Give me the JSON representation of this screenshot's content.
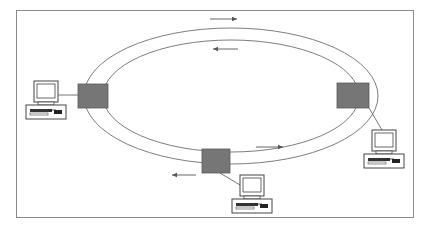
{
  "diagram": {
    "type": "token-ring-network",
    "frame": {
      "x": 16,
      "y": 10,
      "width": 397,
      "height": 207,
      "stroke": "#8a8a8a"
    },
    "colors": {
      "background": "#ffffff",
      "ring_line": "#6e6e6e",
      "switch_fill": "#767676",
      "switch_stroke": "#5a5a5a",
      "computer_stroke": "#444444",
      "arrow": "#555555"
    },
    "ring": {
      "outer": {
        "cx": 231,
        "cy": 96,
        "rx": 147,
        "ry": 68
      },
      "inner": {
        "cx": 231,
        "cy": 96,
        "rx": 128,
        "ry": 56
      }
    },
    "switches": [
      {
        "id": "left",
        "x": 78,
        "y": 84,
        "w": 30,
        "h": 24
      },
      {
        "id": "right",
        "x": 337,
        "y": 83,
        "w": 32,
        "h": 25
      },
      {
        "id": "bottom",
        "x": 202,
        "y": 149,
        "w": 28,
        "h": 24
      }
    ],
    "computers": [
      {
        "id": "left",
        "x": 26,
        "y": 81,
        "link": [
          58,
          95,
          78,
          95
        ]
      },
      {
        "id": "right",
        "x": 364,
        "y": 130,
        "link": [
          369,
          108,
          382,
          130
        ]
      },
      {
        "id": "bottom",
        "x": 232,
        "y": 175,
        "link": [
          220,
          173,
          240,
          185
        ]
      }
    ],
    "arrows": [
      {
        "id": "outer-top",
        "x1": 210,
        "y1": 19,
        "x2": 237,
        "y2": 19,
        "direction": "right"
      },
      {
        "id": "inner-top",
        "x1": 238,
        "y1": 49,
        "x2": 213,
        "y2": 49,
        "direction": "left"
      },
      {
        "id": "inner-bottom",
        "x1": 256,
        "y1": 147,
        "x2": 283,
        "y2": 147,
        "direction": "right"
      },
      {
        "id": "outer-bottom",
        "x1": 196,
        "y1": 175,
        "x2": 172,
        "y2": 175,
        "direction": "left"
      }
    ]
  }
}
